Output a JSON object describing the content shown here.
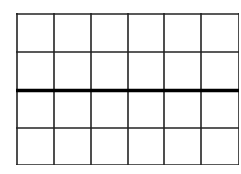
{
  "diagram": {
    "type": "grid",
    "columns": 6,
    "rows": 4,
    "line_color": "#222222",
    "thick_line_color": "#000000",
    "thick_divider_after_row": 2,
    "vertical_lines_x": [
      0,
      37,
      74,
      111,
      147,
      184,
      222
    ],
    "horizontal_lines_y": [
      0,
      38,
      76,
      114,
      151
    ]
  }
}
